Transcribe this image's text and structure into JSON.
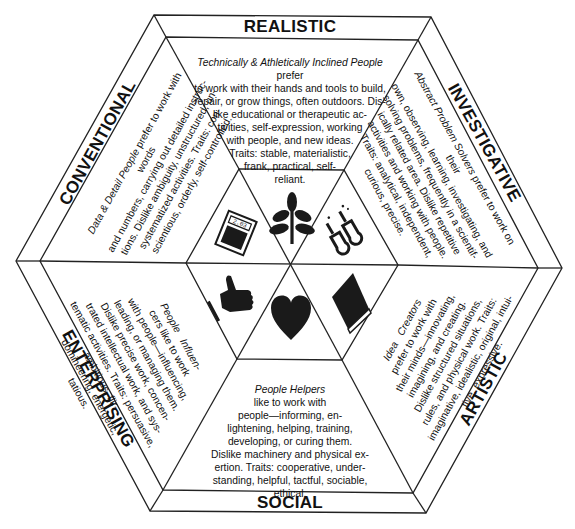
{
  "diagram": {
    "type": "RIASEC hexagon",
    "sections": [
      {
        "key": "realistic",
        "label": "REALISTIC",
        "icon": "plant-sprout-icon",
        "title": "Technically & Athletically Inclined People",
        "body": "prefer to work with their hands and tools to build, repair, or grow things, often outdoors. Dislike educational or therapeutic activities, self-expression, working with people, and new ideas. Traits: stable, materialistic, frank, practical, self-reliant."
      },
      {
        "key": "investigative",
        "label": "INVESTIGATIVE",
        "icon": "test-tubes-icon",
        "title": "Abstract Problem Solvers",
        "body": "prefer to work on their own, observing, learning, investigating, and solving problems, frequently in a scientifically related area. Dislike repetitive activities and working with people. Traits: analytical, independent, curious, precise."
      },
      {
        "key": "artistic",
        "label": "ARTISTIC",
        "icon": "book-icon",
        "title": "Idea Creators",
        "body": "prefer to work with their minds—innovating, imagining, and creating. Dislike structured situations, rules, and physical work. Traits: imaginative, idealistic, original, intuitive, expressive."
      },
      {
        "key": "social",
        "label": "SOCIAL",
        "icon": "heart-icon",
        "title": "People Helpers",
        "body": "like to work with people—informing, enlightening, helping, training, developing, or curing them. Dislike machinery and physical exertion. Traits: cooperative, understanding, helpful, tactful, sociable, ethical."
      },
      {
        "key": "enterprising",
        "label": "ENTERPRISING",
        "icon": "thumbs-up-hand-icon",
        "title": "People Influencers",
        "body": "like to work with people—influencing, leading, or managing them. Dislike precise work, concentrated intellectual work, and systematic activities. Traits: persuasive, ambitious, flirtatious, domineering, energetic."
      },
      {
        "key": "conventional",
        "label": "CONVENTIONAL",
        "icon": "calculator-icon",
        "title": "Data & Detail People",
        "body": "prefer to work with words and numbers, carrying out detailed instructions. Dislike ambiguity, unstructured, unsystematized activities. Traits: conscientious, orderly, self-controlled."
      }
    ]
  },
  "realistic": {
    "label": "REALISTIC",
    "title": "Technically & Athletically Inclined People",
    "lines": [
      "prefer",
      "to work with their hands and tools to build,",
      "repair, or grow things, often outdoors. Dis-",
      "like educational or therapeutic ac-",
      "tivities, self-expression, working",
      "with people, and new ideas.",
      "Traits: stable, materialistic,",
      "frank, practical, self-",
      "reliant."
    ]
  },
  "investigative": {
    "label": "INVESTIGATIVE",
    "title": "Abstract Problem Solvers",
    "lines": [
      "prefer to work on their",
      "own, observing, learning, investigating, and",
      "solving problems, frequently in a scientif-",
      "ically related area. Dislike repetitive",
      "activities and working with people.",
      "Traits: analytical, independent,",
      "curious, precise."
    ]
  },
  "artistic": {
    "label": "ARTISTIC",
    "title_a": "Idea",
    "title_b": "Creators",
    "lines": [
      "prefer to work with",
      "their minds—innovating,",
      "imagining, and creating.",
      "Dislike structured situations,",
      "rules, and physical work. Traits:",
      "imaginative, idealistic, original, intui-",
      "tive, expressive."
    ]
  },
  "social": {
    "label": "SOCIAL",
    "title": "People Helpers",
    "lines": [
      "like to work with",
      "people—informing, en-",
      "lightening, helping, training,",
      "developing, or curing them.",
      "Dislike machinery and physical ex-",
      "ertion. Traits: cooperative, under-",
      "standing, helpful, tactful, sociable, ethical."
    ]
  },
  "enterprising": {
    "label": "ENTERPRISING",
    "title_a": "People",
    "title_b": "Influen-",
    "lines": [
      "cers like to work",
      "with people—influencing,",
      "leading, or managing them.",
      "Dislike precise work, concen-",
      "trated intellectual work, and sys-",
      "tematic activities. Traits: persuasive,",
      "ambitious, flir-",
      "domineering, energetic,",
      "tatious."
    ]
  },
  "conventional": {
    "label": "CONVENTIONAL",
    "title": "Data & Detail People",
    "lines": [
      "prefer to work with words",
      "and numbers, carrying out detailed instruc-",
      "tions. Dislike ambiguity, unstructured, un-",
      "systematized activities. Traits: con-",
      "scientious, orderly, self-controlled."
    ]
  },
  "icons": {
    "calculator_display": "2.03"
  },
  "colors": {
    "line": "#222222",
    "text": "#111111",
    "icon_fill": "#1a1a1a",
    "background": "#ffffff"
  }
}
